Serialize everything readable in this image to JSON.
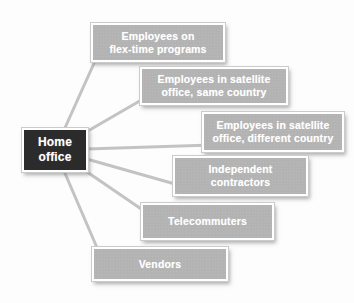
{
  "diagram": {
    "center_node": {
      "id": "home-office",
      "label": "Home office",
      "lines": [
        "Home",
        "office"
      ]
    },
    "nodes": [
      {
        "id": "flex-time",
        "label": "Employees on flex-time programs",
        "lines": [
          "Employees on",
          "flex-time programs"
        ]
      },
      {
        "id": "satellite-same",
        "label": "Employees in satellite office, same country",
        "lines": [
          "Employees in satellite",
          "office, same country"
        ]
      },
      {
        "id": "satellite-different",
        "label": "Employees in satellite office, different country",
        "lines": [
          "Employees in satellite",
          "office, different country"
        ]
      },
      {
        "id": "independent-contractors",
        "label": "Independent contractors",
        "lines": [
          "Independent",
          "contractors"
        ]
      },
      {
        "id": "telecommuters",
        "label": "Telecommuters",
        "lines": [
          "Telecommuters"
        ]
      },
      {
        "id": "vendors",
        "label": "Vendors",
        "lines": [
          "Vendors"
        ]
      }
    ],
    "connections": [
      {
        "from": "home-office",
        "to": "flex-time"
      },
      {
        "from": "home-office",
        "to": "satellite-same"
      },
      {
        "from": "home-office",
        "to": "satellite-different"
      },
      {
        "from": "home-office",
        "to": "independent-contractors"
      },
      {
        "from": "home-office",
        "to": "telecommuters"
      },
      {
        "from": "home-office",
        "to": "vendors"
      }
    ],
    "colors": {
      "node_fill": "#b3b3b3",
      "center_node_fill": "#2b2b2b",
      "node_border": "#ffffff",
      "text": "#ffffff",
      "connector": "#c3c3c3",
      "background": "#fdfdfd"
    }
  }
}
